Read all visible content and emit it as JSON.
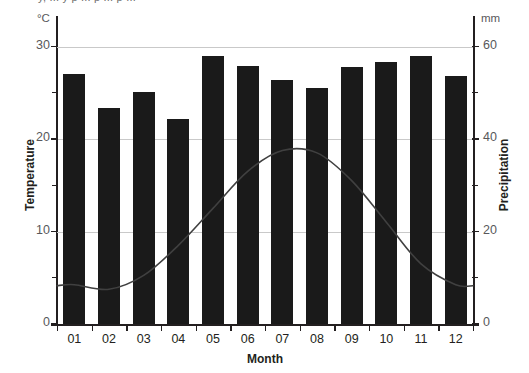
{
  "caption": "y, ... y p ... p ... p ... ",
  "axes": {
    "left_unit": "°C",
    "right_unit": "mm",
    "left_title": "Temperature",
    "right_title": "Precipitation",
    "bottom_title": "Month"
  },
  "chart_data": {
    "type": "bar",
    "title": "",
    "xlabel": "Month",
    "ylabel": "Temperature",
    "y2label": "Precipitation",
    "categories": [
      "01",
      "02",
      "03",
      "04",
      "05",
      "06",
      "07",
      "08",
      "09",
      "10",
      "11",
      "12"
    ],
    "grid": true,
    "legend": "none",
    "ylim": [
      0,
      32
    ],
    "y2lim": [
      0,
      64
    ],
    "yticks": [
      0,
      10,
      20,
      30
    ],
    "yticklabels": [
      "0",
      "10",
      "20",
      "30"
    ],
    "yminorticks": [
      5,
      15,
      25
    ],
    "y2ticks": [
      0,
      20,
      40,
      60
    ],
    "y2ticklabels": [
      "0",
      "20",
      "40",
      "60"
    ],
    "y2minorticks": [
      10,
      30,
      50
    ],
    "series": [
      {
        "name": "Temperature",
        "type": "bar",
        "axis": "left",
        "unit": "°C",
        "color": "#1a1a1a",
        "values": [
          27.0,
          23.4,
          25.1,
          22.2,
          29.0,
          27.9,
          26.4,
          25.5,
          27.8,
          28.3,
          29.0,
          26.8
        ]
      },
      {
        "name": "Precipitation",
        "type": "line",
        "axis": "right",
        "unit": "mm",
        "color": "#404040",
        "values": [
          8.5,
          7.5,
          10.5,
          17.0,
          25.0,
          33.0,
          37.5,
          37.0,
          31.0,
          22.0,
          13.0,
          8.5
        ]
      }
    ]
  }
}
